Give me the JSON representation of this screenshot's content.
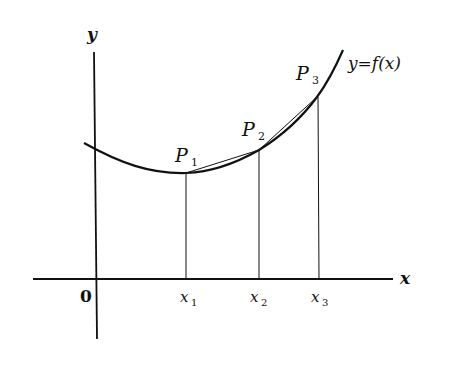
{
  "diagram": {
    "axes": {
      "x_label": "x",
      "y_label": "y",
      "origin_label": "0"
    },
    "curve": {
      "label": "y=f(x)"
    },
    "points": [
      {
        "label": "P",
        "sub": "1"
      },
      {
        "label": "P",
        "sub": "2"
      },
      {
        "label": "P",
        "sub": "3"
      }
    ],
    "ticks": [
      {
        "label": "x",
        "sub": "1"
      },
      {
        "label": "x",
        "sub": "2"
      },
      {
        "label": "x",
        "sub": "3"
      }
    ],
    "colors": {
      "ink": "#111111",
      "background": "#ffffff"
    }
  }
}
